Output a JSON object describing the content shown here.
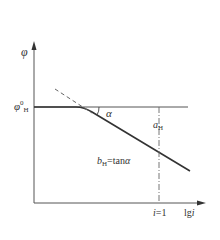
{
  "diagram": {
    "colors": {
      "line": "#333333",
      "axis": "#555555",
      "dashed": "#666666",
      "text": "#333333",
      "background": "#ffffff"
    },
    "y_axis": {
      "symbol": "φ"
    },
    "x_axis": {
      "symbol_prefix": "lg",
      "symbol_var": "i"
    },
    "baseline_label": {
      "symbol": "φ",
      "superscript": "0",
      "subscript": "H"
    },
    "angle_label": "α",
    "intercept_label": {
      "symbol": "a",
      "subscript": "H"
    },
    "slope_label": {
      "symbol": "b",
      "subscript": "H",
      "equation": "=tan",
      "angle": "α"
    },
    "tick_label": {
      "var": "i",
      "value": "=1"
    }
  }
}
